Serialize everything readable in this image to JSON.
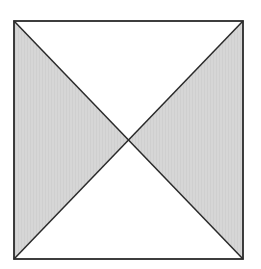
{
  "diagram": {
    "type": "geometric-figure",
    "square": {
      "x1": 14,
      "y1": 21,
      "x2": 243,
      "y2": 259
    },
    "center": {
      "x": 128,
      "y": 140
    },
    "colors": {
      "background": "#ffffff",
      "shaded_fill": "#d6d6d6",
      "unshaded_fill": "#ffffff",
      "stroke": "#2a2a2a"
    },
    "regions": [
      {
        "name": "left-triangle",
        "shaded": true
      },
      {
        "name": "right-triangle",
        "shaded": true
      },
      {
        "name": "top-triangle",
        "shaded": false
      },
      {
        "name": "bottom-triangle",
        "shaded": false
      }
    ]
  }
}
